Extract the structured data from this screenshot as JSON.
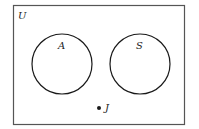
{
  "diagram": {
    "type": "venn",
    "universe": {
      "label": "U",
      "x": 13,
      "y": 5,
      "width": 171,
      "height": 119
    },
    "sets": [
      {
        "label": "A",
        "cx": 62,
        "cy": 64,
        "r": 30,
        "label_x": 59,
        "label_y": 49
      },
      {
        "label": "S",
        "cx": 140,
        "cy": 64,
        "r": 30,
        "label_x": 137,
        "label_y": 49
      }
    ],
    "points": [
      {
        "label": "J",
        "x": 99,
        "y": 108,
        "label_x": 105,
        "label_y": 111
      }
    ],
    "colors": {
      "stroke": "#1a1a1a",
      "border": "#555555",
      "background": "#ffffff"
    }
  }
}
